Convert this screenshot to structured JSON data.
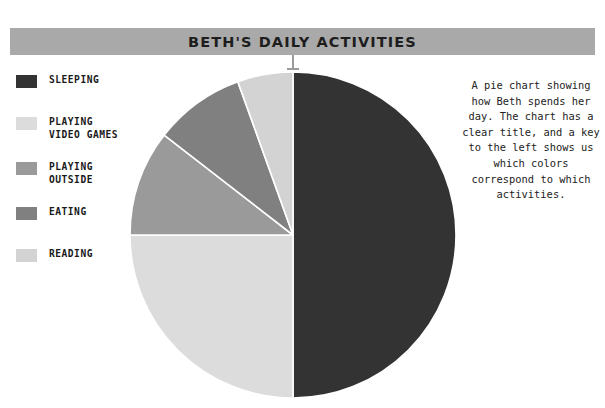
{
  "title": {
    "text": "BETH'S DAILY ACTIVITIES",
    "bar_color": "#a9a9a9",
    "text_color": "#1d1d1d"
  },
  "legend": {
    "items": [
      {
        "label": "SLEEPING",
        "color": "#333333"
      },
      {
        "label": "PLAYING\nVIDEO GAMES",
        "color": "#dcdcdc"
      },
      {
        "label": "PLAYING\nOUTSIDE",
        "color": "#9a9a9a"
      },
      {
        "label": "EATING",
        "color": "#808080"
      },
      {
        "label": "READING",
        "color": "#d3d3d3"
      }
    ]
  },
  "description": {
    "text": "A pie chart showing how Beth spends her day. The chart has a clear title, and a key to the left shows us which colors correspond to which activities."
  },
  "chart_data": {
    "type": "pie",
    "title": "BETH'S DAILY ACTIVITIES",
    "xlabel": "",
    "ylabel": "",
    "legend_position": "left",
    "grid": false,
    "categories": [
      "SLEEPING",
      "PLAYING VIDEO GAMES",
      "PLAYING OUTSIDE",
      "EATING",
      "READING"
    ],
    "values": [
      50,
      25,
      10.5,
      9,
      5.5
    ],
    "units": "percent",
    "colors": [
      "#333333",
      "#dcdcdc",
      "#9a9a9a",
      "#808080",
      "#d3d3d3"
    ],
    "slices": [
      {
        "label": "SLEEPING",
        "percent": 50,
        "start_deg": 0,
        "end_deg": 180,
        "color": "#333333"
      },
      {
        "label": "PLAYING VIDEO GAMES",
        "percent": 25,
        "start_deg": 180,
        "end_deg": 270,
        "color": "#dcdcdc"
      },
      {
        "label": "PLAYING OUTSIDE",
        "percent": 10.5,
        "start_deg": 270,
        "end_deg": 307.8,
        "color": "#9a9a9a"
      },
      {
        "label": "EATING",
        "percent": 9,
        "start_deg": 307.8,
        "end_deg": 340.2,
        "color": "#808080"
      },
      {
        "label": "READING",
        "percent": 5.5,
        "start_deg": 340.2,
        "end_deg": 360,
        "color": "#d3d3d3"
      }
    ],
    "geometry": {
      "cx": 165,
      "cy": 165,
      "r": 163,
      "separator_color": "#ffffff",
      "separator_width": 1.6
    }
  }
}
